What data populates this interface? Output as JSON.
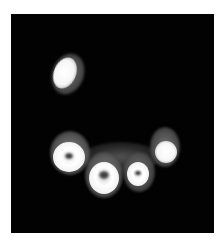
{
  "image": {
    "description": "Axial CT slice showing cross-sections of teeth on a black background",
    "background_color": "#020202",
    "frame_color": "#ffffff",
    "structures": [
      {
        "name": "isolated-tooth-upper-left",
        "center": [
          67,
          72
        ]
      },
      {
        "name": "tooth-lower-left",
        "center": [
          68,
          155
        ]
      },
      {
        "name": "tooth-lower-middle",
        "center": [
          100,
          170
        ]
      },
      {
        "name": "tooth-lower-small",
        "center": [
          137,
          168
        ]
      },
      {
        "name": "tooth-right",
        "center": [
          163,
          143
        ]
      }
    ]
  }
}
